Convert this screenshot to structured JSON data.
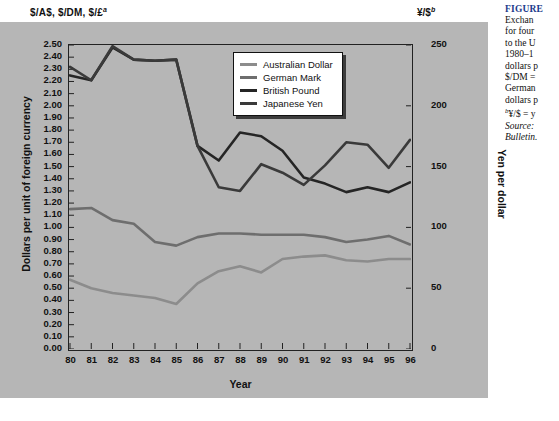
{
  "figure": {
    "top_left_axis_label": "$/A$, $/DM, $/£",
    "top_left_axis_superscript": "a",
    "top_right_axis_label": "¥/$",
    "top_right_axis_superscript": "b"
  },
  "caption": {
    "title": "FIGURE",
    "lines": [
      "Exchan",
      "for four",
      "to the U",
      "1980–1",
      "dollars p",
      "$/DM =",
      "German",
      "dollars p",
      "¥/$ = y",
      "Source:",
      "Bulletin."
    ],
    "line_superscripts": [
      "",
      "",
      "",
      "",
      "",
      "",
      "",
      "",
      "b",
      "",
      ""
    ],
    "italic_lines": [
      false,
      false,
      false,
      false,
      false,
      false,
      false,
      false,
      false,
      true,
      true
    ],
    "title_color": "#1b3a8c"
  },
  "legend": {
    "position": "inside-top-right",
    "items": [
      {
        "label": "Australian Dollar",
        "color": "#8c8c8c"
      },
      {
        "label": "German Mark",
        "color": "#6e6e6e"
      },
      {
        "label": "British Pound",
        "color": "#252525"
      },
      {
        "label": "Japanese Yen",
        "color": "#3a3a3a"
      }
    ]
  },
  "chart_data": {
    "type": "line",
    "title": "",
    "xlabel": "Year",
    "ylabel": "Dollars per unit of foreign currency",
    "y2label": "Yen per dollar",
    "grid": false,
    "legend_position": "inside-top-right",
    "x": [
      "80",
      "81",
      "82",
      "83",
      "84",
      "85",
      "86",
      "87",
      "88",
      "89",
      "90",
      "91",
      "92",
      "93",
      "94",
      "95",
      "96"
    ],
    "categories": [
      "80",
      "81",
      "82",
      "83",
      "84",
      "85",
      "86",
      "87",
      "88",
      "89",
      "90",
      "91",
      "92",
      "93",
      "94",
      "95",
      "96"
    ],
    "ylim": [
      0.0,
      2.5
    ],
    "ytick_step": 0.1,
    "yticks": [
      "2.50",
      "2.40",
      "2.30",
      "2.20",
      "2.10",
      "2.00",
      "1.90",
      "1.80",
      "1.70",
      "1.60",
      "1.50",
      "1.40",
      "1.30",
      "1.20",
      "1.10",
      "1.00",
      "0.90",
      "0.80",
      "0.70",
      "0.60",
      "0.50",
      "0.40",
      "0.30",
      "0.20",
      "0.10",
      "0.00"
    ],
    "y2lim": [
      0,
      250
    ],
    "y2ticks": [
      "250",
      "200",
      "150",
      "100",
      "50",
      "0"
    ],
    "series": [
      {
        "name": "Australian Dollar",
        "axis": "left",
        "unit": "US dollars per Australian dollar",
        "color": "#8c8c8c",
        "values": [
          0.57,
          0.5,
          0.46,
          0.44,
          0.42,
          0.37,
          0.54,
          0.64,
          0.68,
          0.63,
          0.74,
          0.76,
          0.77,
          0.73,
          0.72,
          0.74,
          0.74
        ]
      },
      {
        "name": "German Mark",
        "axis": "left",
        "unit": "US dollars per German mark",
        "color": "#6e6e6e",
        "values": [
          1.15,
          1.16,
          1.06,
          1.03,
          0.88,
          0.85,
          0.92,
          0.95,
          0.95,
          0.94,
          0.94,
          0.94,
          0.92,
          0.88,
          0.9,
          0.93,
          0.86
        ]
      },
      {
        "name": "British Pound",
        "axis": "left",
        "unit": "US dollars per British pound",
        "color": "#252525",
        "values": [
          2.25,
          2.21,
          2.48,
          2.38,
          2.37,
          2.38,
          1.67,
          1.55,
          1.78,
          1.75,
          1.63,
          1.41,
          1.36,
          1.29,
          1.33,
          1.29,
          1.37
        ]
      },
      {
        "name": "Japanese Yen",
        "axis": "right",
        "unit": "yen per US dollar",
        "color": "#3a3a3a",
        "values": [
          232,
          221,
          249,
          238,
          237,
          238,
          167,
          133,
          130,
          152,
          145,
          135,
          151,
          170,
          168,
          149,
          172
        ]
      }
    ]
  }
}
